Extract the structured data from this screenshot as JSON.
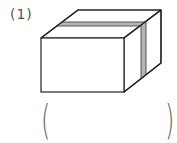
{
  "question": {
    "number_label": "(1)",
    "answer_open": "(",
    "answer_close": ")"
  },
  "figure": {
    "colors": {
      "outline": "#222222",
      "face": "#ffffff",
      "band_fill": "#b5b5b5",
      "band_edge": "#555555"
    },
    "vertices": {
      "front": [
        [
          41,
          38
        ],
        [
          124,
          38
        ],
        [
          124,
          92
        ],
        [
          41,
          92
        ]
      ],
      "top": [
        [
          41,
          38
        ],
        [
          124,
          38
        ],
        [
          161,
          10
        ],
        [
          78,
          10
        ]
      ],
      "right": [
        [
          124,
          38
        ],
        [
          161,
          10
        ],
        [
          161,
          63
        ],
        [
          124,
          92
        ]
      ]
    }
  }
}
